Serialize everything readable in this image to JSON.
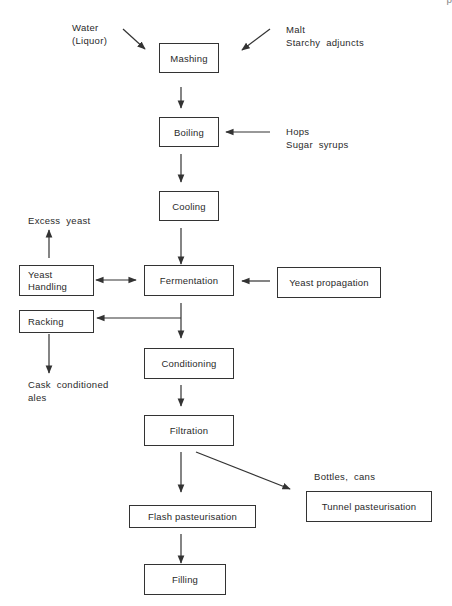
{
  "page_corner": "p",
  "inputs": {
    "water": [
      "Water",
      "(Liquor)"
    ],
    "malt": [
      "Malt",
      "Starchy  adjuncts"
    ],
    "hops": [
      "Hops",
      "Sugar  syrups"
    ],
    "excess_yeast": "Excess  yeast",
    "cask_ales": [
      "Cask  conditioned",
      "ales"
    ],
    "bottles_cans": "Bottles,  cans"
  },
  "steps": {
    "mashing": "Mashing",
    "boiling": "Boiling",
    "cooling": "Cooling",
    "fermentation": "Fermentation",
    "yeast_propagation": "Yeast  propagation",
    "yeast_handling": [
      "Yeast",
      "Handling"
    ],
    "racking": "Racking",
    "conditioning": "Conditioning",
    "filtration": "Filtration",
    "flash_pasteurisation": "Flash  pasteurisation",
    "tunnel_pasteurisation": "Tunnel  pasteurisation",
    "filling": "Filling"
  },
  "colors": {
    "line": "#333333",
    "text": "#2a2a2a"
  }
}
